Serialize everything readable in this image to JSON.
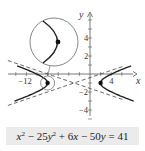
{
  "chart_data": {
    "type": "line",
    "title": "",
    "xlabel": "x",
    "ylabel": "y",
    "xlim": [
      -16,
      7
    ],
    "ylim": [
      -5,
      6.5
    ],
    "x_tick_labels": [
      "-12",
      "4"
    ],
    "y_tick_labels": [
      "4",
      "2",
      "-2",
      "-4"
    ],
    "equation": {
      "lhs_parts": [
        "x",
        "2",
        " − 25",
        "y",
        "2",
        " + 6",
        "x",
        " − 50",
        "y",
        " = 41"
      ],
      "text": "x^2 − 25y^2 + 6x − 50y = 41"
    },
    "series": [
      {
        "name": "hyperbola",
        "kind": "curve",
        "center": [
          -3,
          -1
        ],
        "a": 5,
        "b": 1,
        "vertices": [
          [
            -8,
            -1
          ],
          [
            2,
            -1
          ]
        ],
        "style": "solid"
      },
      {
        "name": "asymptotes",
        "kind": "lines",
        "slopes": [
          0.2,
          -0.2
        ],
        "through": [
          -3,
          -1
        ],
        "style": "dashed"
      },
      {
        "name": "vertex-points",
        "kind": "points",
        "points": [
          [
            -8,
            -1
          ],
          [
            2,
            -1
          ]
        ]
      }
    ],
    "inset": {
      "description": "magnified view of left vertex",
      "source_point": [
        -8,
        -1
      ]
    },
    "grid": false,
    "legend": "none"
  }
}
